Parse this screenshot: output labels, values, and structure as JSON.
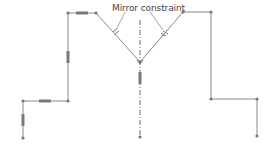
{
  "diagram": {
    "title": "Mirror constraint",
    "colors": {
      "line": "#8a8a8a",
      "point": "#777777",
      "constraint_marker": "#7a7a7a",
      "axis": "#6a6a6a",
      "text": "#444444",
      "background": "#ffffff"
    },
    "annotation": {
      "label": "Mirror constraint",
      "x": 112,
      "y": 3
    },
    "left_shape": {
      "points": [
        [
          23,
          138
        ],
        [
          23,
          101
        ],
        [
          68,
          101
        ],
        [
          68,
          13
        ],
        [
          96,
          13
        ],
        [
          140,
          62
        ]
      ]
    },
    "right_shape": {
      "points": [
        [
          140,
          62
        ],
        [
          183,
          12
        ],
        [
          211,
          12
        ],
        [
          211,
          99
        ],
        [
          257,
          99
        ],
        [
          257,
          136
        ]
      ]
    },
    "mirror_axis": {
      "x": 140,
      "y1": 20,
      "y2": 137,
      "style": "dash-dot"
    },
    "nodes": [
      {
        "x": 23,
        "y": 138
      },
      {
        "x": 23,
        "y": 101
      },
      {
        "x": 68,
        "y": 101
      },
      {
        "x": 68,
        "y": 13
      },
      {
        "x": 96,
        "y": 13
      },
      {
        "x": 140,
        "y": 62
      },
      {
        "x": 183,
        "y": 12
      },
      {
        "x": 211,
        "y": 12
      },
      {
        "x": 211,
        "y": 99
      },
      {
        "x": 257,
        "y": 99
      },
      {
        "x": 257,
        "y": 136
      },
      {
        "x": 140,
        "y": 137
      }
    ],
    "horizontal_markers": [
      {
        "x": 82,
        "y": 13
      },
      {
        "x": 45,
        "y": 101
      }
    ],
    "vertical_markers": [
      {
        "x": 68,
        "y": 57
      },
      {
        "x": 23,
        "y": 120
      },
      {
        "x": 140,
        "y": 78
      }
    ],
    "leader_lines": [
      {
        "from": [
          125,
          12
        ],
        "to": [
          116,
          30
        ]
      },
      {
        "from": [
          150,
          12
        ],
        "to": [
          163,
          30
        ]
      }
    ]
  }
}
